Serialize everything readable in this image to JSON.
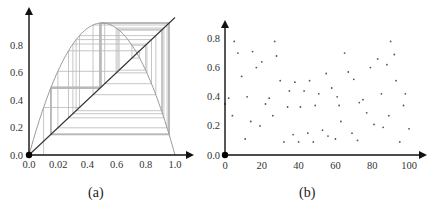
{
  "chart_data": [
    {
      "id": "a",
      "type": "line",
      "title": "",
      "caption": "(a)",
      "description": "Cobweb diagram of logistic map x(n+1) = r x(n) (1 - x(n)) with diagonal y = x",
      "xlabel": "",
      "ylabel": "",
      "xlim": [
        0,
        1.0
      ],
      "ylim": [
        0,
        1.0
      ],
      "x_ticks": [
        "0.0",
        "0.02",
        "0.4",
        "0.6",
        "0.8",
        "1.0"
      ],
      "x_tick_values": [
        0,
        0.2,
        0.4,
        0.6,
        0.8,
        1.0
      ],
      "y_ticks": [
        "0.0",
        "0.2",
        "0.4",
        "0.6",
        "0.8"
      ],
      "y_tick_values": [
        0,
        0.2,
        0.4,
        0.6,
        0.8
      ],
      "grid": false,
      "series": [
        {
          "name": "logistic-curve",
          "r": 3.84,
          "peak": 0.96,
          "color": "#9a9a9a"
        },
        {
          "name": "diagonal",
          "x": [
            0,
            1.0
          ],
          "y": [
            0,
            1.0
          ],
          "color": "#333333"
        },
        {
          "name": "cobweb",
          "x0": 0.1,
          "iterations": 40,
          "color": "#b8b8b8"
        }
      ]
    },
    {
      "id": "b",
      "type": "scatter",
      "title": "",
      "caption": "(b)",
      "xlabel": "",
      "ylabel": "",
      "xlim": [
        0,
        100
      ],
      "ylim": [
        0,
        0.85
      ],
      "x_ticks": [
        "0",
        "20",
        "40",
        "60",
        "80",
        "100"
      ],
      "x_tick_values": [
        0,
        20,
        40,
        60,
        80,
        100
      ],
      "y_ticks": [
        "0.0",
        "0.2",
        "0.4",
        "0.6",
        "0.8"
      ],
      "y_tick_values": [
        0,
        0.2,
        0.4,
        0.6,
        0.8
      ],
      "grid": false,
      "color": "#555555",
      "x": [
        0,
        2,
        4,
        5,
        7,
        9,
        11,
        12,
        14,
        15,
        17,
        19,
        20,
        22,
        24,
        26,
        27,
        28,
        30,
        32,
        34,
        35,
        37,
        38,
        40,
        41,
        43,
        45,
        46,
        48,
        49,
        51,
        53,
        55,
        56,
        58,
        60,
        61,
        62,
        63,
        65,
        67,
        69,
        70,
        72,
        73,
        75,
        77,
        79,
        81,
        83,
        85,
        86,
        88,
        89,
        90,
        92,
        93,
        95,
        97,
        98,
        100
      ],
      "y": [
        0.35,
        0.39,
        0.27,
        0.78,
        0.7,
        0.54,
        0.11,
        0.4,
        0.23,
        0.71,
        0.6,
        0.2,
        0.64,
        0.35,
        0.39,
        0.27,
        0.78,
        0.68,
        0.51,
        0.09,
        0.33,
        0.44,
        0.14,
        0.5,
        0.09,
        0.33,
        0.44,
        0.15,
        0.51,
        0.09,
        0.34,
        0.42,
        0.17,
        0.56,
        0.13,
        0.46,
        0.11,
        0.4,
        0.34,
        0.23,
        0.7,
        0.57,
        0.15,
        0.52,
        0.1,
        0.36,
        0.38,
        0.29,
        0.6,
        0.21,
        0.66,
        0.42,
        0.19,
        0.62,
        0.27,
        0.78,
        0.69,
        0.51,
        0.09,
        0.34,
        0.42,
        0.18
      ]
    }
  ],
  "captions": {
    "a": "(a)",
    "b": "(b)"
  }
}
